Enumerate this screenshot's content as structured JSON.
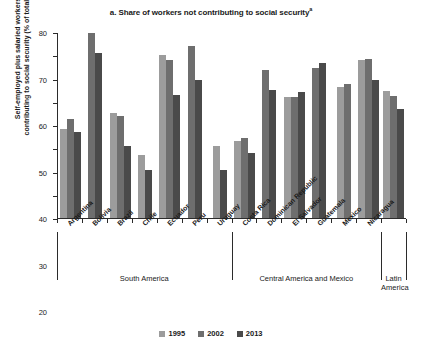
{
  "chart_data": {
    "type": "bar",
    "title": "a. Share of workers not contributing to social security",
    "title_superscript": "a",
    "xlabel": "",
    "ylabel": "Self-employed plus salaried workers not contributing to social security (% of total workers)",
    "ylabel_line1": "Self-employed plus salaried workers not",
    "ylabel_line2": "contributing to social security (% of total workers)",
    "ylim": [
      0,
      80
    ],
    "yticks": [
      0,
      10,
      20,
      30,
      40,
      50,
      60,
      70,
      80
    ],
    "grid": false,
    "legend_position": "bottom",
    "categories": [
      "Argentina",
      "Bolivia",
      "Brazil",
      "Chile",
      "Ecuador",
      "Peru",
      "Uruguay",
      "Costa Rica",
      "Dominican Republic",
      "El Salvador",
      "Guatemala",
      "Mexico",
      "Nicaragua",
      "Latin America"
    ],
    "series": [
      {
        "name": "1995",
        "color": "#9c9c9c",
        "values": [
          38.5,
          null,
          45.0,
          27.0,
          70.0,
          null,
          31.0,
          33.0,
          null,
          52.0,
          null,
          56.5,
          68.0,
          54.5
        ]
      },
      {
        "name": "2002",
        "color": "#6e6e6e",
        "values": [
          42.5,
          79.5,
          44.0,
          null,
          68.0,
          74.0,
          null,
          34.5,
          63.5,
          52.0,
          64.5,
          57.5,
          68.5,
          52.5
        ]
      },
      {
        "name": "2013",
        "color": "#4a4a4a",
        "values": [
          37.0,
          71.0,
          31.0,
          20.5,
          53.0,
          59.5,
          20.5,
          28.0,
          55.0,
          54.0,
          66.5,
          null,
          59.5,
          47.0
        ]
      }
    ],
    "groups": [
      {
        "label": "South America",
        "start": 0,
        "end": 6
      },
      {
        "label": "Central America and Mexico",
        "start": 7,
        "end": 12
      },
      {
        "label": "Latin America",
        "start": 13,
        "end": 13
      }
    ]
  },
  "legend": {
    "items": [
      {
        "label": "1995"
      },
      {
        "label": "2002"
      },
      {
        "label": "2013"
      }
    ]
  }
}
